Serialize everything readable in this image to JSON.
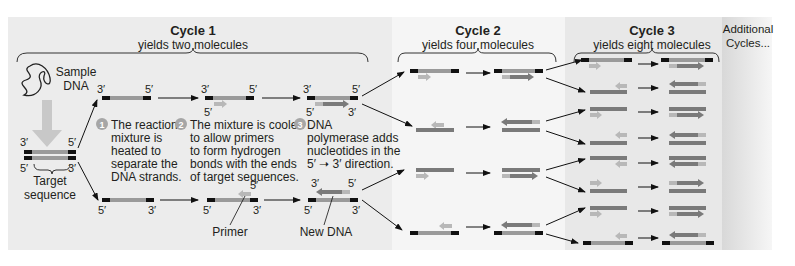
{
  "cycles": [
    {
      "title": "Cycle 1",
      "subtitle": "yields two molecules"
    },
    {
      "title": "Cycle 2",
      "subtitle": "yields four molecules"
    },
    {
      "title": "Cycle 3",
      "subtitle": "yields eight molecules"
    }
  ],
  "additional": {
    "line1": "Additional",
    "line2": "Cycles..."
  },
  "sample": {
    "line1": "Sample",
    "line2": "DNA"
  },
  "target": {
    "line1": "Target",
    "line2": "sequence"
  },
  "ends": {
    "three": "3′",
    "five": "5′"
  },
  "steps": [
    {
      "num": "1",
      "lines": [
        "The reaction",
        "mixture is",
        "heated to",
        "separate the",
        "DNA strands."
      ]
    },
    {
      "num": "2",
      "lines": [
        "The mixture is cooled",
        "to allow primers",
        "to form hydrogen",
        "bonds with the ends",
        "of target sequences."
      ]
    },
    {
      "num": "3",
      "lines": [
        "DNA",
        "polymerase adds",
        "nucleotides in the",
        "5′ ➝ 3′ direction."
      ]
    }
  ],
  "labels": {
    "primer": "Primer",
    "new_dna": "New DNA"
  },
  "colors": {
    "cycle1_bg": "#ececec",
    "cycle2_bg": "#f4f4f4",
    "cycle3_bg": "#e6e6e6",
    "additional_bg": "#dcdcdc",
    "strand_original": "#9a9a9a",
    "strand_new": "#7a7a7a",
    "primer": "#b8b8b8",
    "end_cap": "#111111",
    "step_badge": "#a6a6a6"
  }
}
